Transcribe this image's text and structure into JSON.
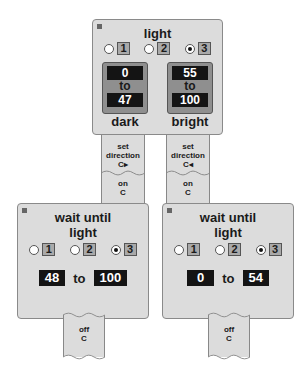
{
  "light_block": {
    "title": "light",
    "ports": [
      {
        "label": "1",
        "selected": false
      },
      {
        "label": "2",
        "selected": false
      },
      {
        "label": "3",
        "selected": true
      }
    ],
    "dark": {
      "from": "0",
      "to_word": "to",
      "to": "47",
      "label": "dark"
    },
    "bright": {
      "from": "55",
      "to_word": "to",
      "to": "100",
      "label": "bright"
    }
  },
  "left_branch": {
    "set_direction": {
      "line1": "set",
      "line2": "direction",
      "line3": "C▸"
    },
    "on": {
      "line1": "on",
      "line2": "C"
    },
    "wait": {
      "title1": "wait until",
      "title2": "light",
      "ports": [
        {
          "label": "1",
          "selected": false
        },
        {
          "label": "2",
          "selected": false
        },
        {
          "label": "3",
          "selected": true
        }
      ],
      "from": "48",
      "to_word": "to",
      "to": "100"
    },
    "off": {
      "line1": "off",
      "line2": "C"
    }
  },
  "right_branch": {
    "set_direction": {
      "line1": "set",
      "line2": "direction",
      "line3": "C◂"
    },
    "on": {
      "line1": "on",
      "line2": "C"
    },
    "wait": {
      "title1": "wait until",
      "title2": "light",
      "ports": [
        {
          "label": "1",
          "selected": false
        },
        {
          "label": "2",
          "selected": false
        },
        {
          "label": "3",
          "selected": true
        }
      ],
      "from": "0",
      "to_word": "to",
      "to": "54"
    },
    "off": {
      "line1": "off",
      "line2": "C"
    }
  },
  "colors": {
    "block": "#dcdcdc",
    "value_box": "#141414",
    "port": "#a9a9a9"
  }
}
